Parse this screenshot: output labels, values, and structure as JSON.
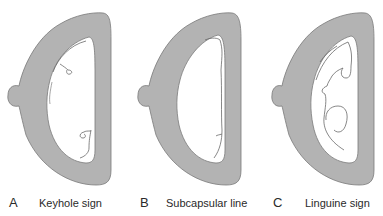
{
  "colors": {
    "tissue": "#b3b3b3",
    "outline": "#7a7a7a",
    "cavity": "#ffffff",
    "line": "#6a6a6a"
  },
  "panels": [
    {
      "letter": "A",
      "caption": "Keyhole sign"
    },
    {
      "letter": "B",
      "caption": "Subcapsular line"
    },
    {
      "letter": "C",
      "caption": "Linguine sign"
    }
  ]
}
